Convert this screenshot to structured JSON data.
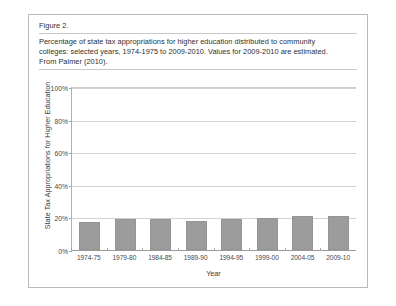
{
  "figure": {
    "label": "Figure 2.",
    "caption_lines": [
      "Percentage of state tax appropriations for higher education distributed to community",
      "colleges: selected years, 1974-1975 to 2009-2010. Values for 2009-2010 are estimated.",
      "From Palmer (2010)."
    ]
  },
  "chart_data": {
    "type": "bar",
    "title": "",
    "categories": [
      "1974-75",
      "1979-80",
      "1984-85",
      "1989-90",
      "1994-95",
      "1999-00",
      "2004-05",
      "2009-10"
    ],
    "values": [
      17,
      19,
      19,
      18,
      19,
      20,
      21,
      21
    ],
    "xlabel": "Year",
    "ylabel": "State Tax Appropriations for Higher Education",
    "ylim": [
      0,
      100
    ],
    "yticks": [
      0,
      20,
      40,
      60,
      80,
      100
    ],
    "ytick_labels": [
      "0%",
      "20%",
      "40%",
      "60%",
      "80%",
      "100%"
    ],
    "grid": true,
    "legend": "none",
    "bar_color": "#9c9c9c"
  }
}
